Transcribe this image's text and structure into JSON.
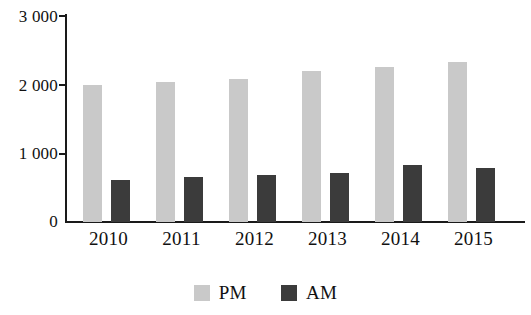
{
  "chart_data": {
    "type": "bar",
    "title": "",
    "subtitle": "",
    "xlabel": "",
    "ylabel": "",
    "categories": [
      "2010",
      "2011",
      "2012",
      "2013",
      "2014",
      "2015"
    ],
    "series": [
      {
        "name": "PM",
        "color": "#c9c9c9",
        "values": [
          1985,
          2030,
          2075,
          2190,
          2250,
          2320
        ]
      },
      {
        "name": "AM",
        "color": "#3b3b3b",
        "values": [
          615,
          660,
          675,
          715,
          830,
          790
        ]
      }
    ],
    "ylim": [
      0,
      3000
    ],
    "ytick_values": [
      0,
      1000,
      2000,
      3000
    ],
    "ytick_labels": [
      "0",
      "1 000",
      "2 000",
      "3 000"
    ],
    "grid": false,
    "legend_position": "bottom",
    "legend_entries": [
      {
        "label": "PM",
        "color": "#c9c9c9"
      },
      {
        "label": "AM",
        "color": "#3b3b3b"
      }
    ],
    "axis_color": "#1a1a1a",
    "background_color": "#ffffff"
  }
}
